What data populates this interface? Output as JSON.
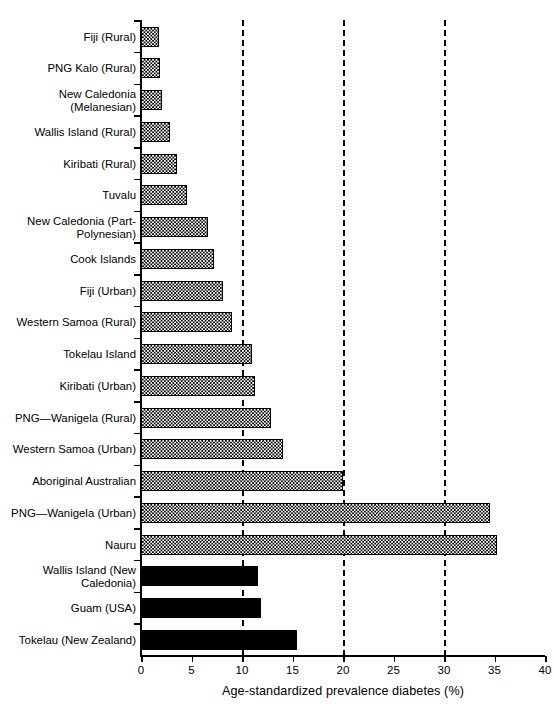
{
  "chart_data": {
    "type": "bar",
    "orientation": "horizontal",
    "title": "",
    "xlabel": "Age-standardized prevalence diabetes (%)",
    "ylabel": "",
    "xlim": [
      0,
      40
    ],
    "xticks": [
      0,
      5,
      10,
      15,
      20,
      25,
      30,
      35,
      40
    ],
    "xtick_labels": [
      "0",
      "5",
      "10",
      "15",
      "20",
      "25",
      "30",
      "35",
      "40"
    ],
    "gridlines": [
      10,
      20,
      30
    ],
    "grid": "dashed vertical gridlines at 10, 20 and 30",
    "legend": "none",
    "categories": [
      "Fiji (Rural)",
      "PNG Kalo (Rural)",
      "New Caledonia\n(Melanesian)",
      "Wallis Island (Rural)",
      "Kiribati (Rural)",
      "Tuvalu",
      "New Caledonia (Part-\nPolynesian)",
      "Cook Islands",
      "Fiji (Urban)",
      "Western Samoa (Rural)",
      "Tokelau Island",
      "Kiribati (Urban)",
      "PNG—Wanigela (Rural)",
      "Western Samoa (Urban)",
      "Aboriginal Australian",
      "PNG—Wanigela (Urban)",
      "Nauru",
      "Wallis Island (New\nCaledonia)",
      "Guam (USA)",
      "Tokelau (New Zealand)"
    ],
    "values": [
      1.8,
      1.9,
      2.1,
      2.9,
      3.6,
      4.6,
      6.6,
      7.2,
      8.1,
      9.0,
      11.0,
      11.3,
      12.9,
      14.1,
      20.0,
      34.6,
      35.2,
      11.6,
      11.9,
      15.4
    ],
    "fills": [
      "hatch",
      "hatch",
      "hatch",
      "hatch",
      "hatch",
      "hatch",
      "hatch",
      "hatch",
      "hatch",
      "hatch",
      "hatch",
      "hatch",
      "hatch",
      "hatch",
      "hatch",
      "hatch",
      "hatch",
      "solid",
      "solid",
      "solid"
    ],
    "colors": {
      "hatch_fill": "#ffffff",
      "hatch_ink": "#000000",
      "solid_fill": "#000000",
      "axis": "#000000"
    }
  }
}
